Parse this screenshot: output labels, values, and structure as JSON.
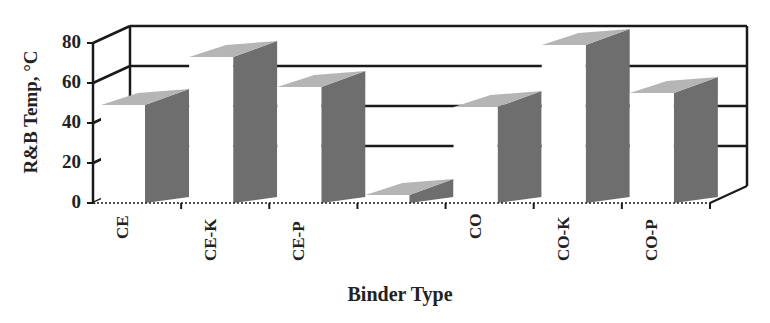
{
  "chart_data": {
    "type": "bar",
    "style": "3d-column",
    "title": "",
    "xlabel": "Binder Type",
    "ylabel": "R&B Temp, °C",
    "categories": [
      "CE",
      "CE-K",
      "CE-P",
      "",
      "CO",
      "CO-K",
      "CO-P"
    ],
    "values": [
      49,
      73,
      58,
      0,
      48,
      79,
      55
    ],
    "yticks": [
      "0",
      "20",
      "40",
      "60",
      "80"
    ],
    "ylim": [
      0,
      80
    ],
    "grid": true,
    "legend": "none",
    "colors": {
      "front": "#ffffff",
      "side": "#6e6e6e",
      "top": "#b5b5b5",
      "axis": "#1a1a1a"
    }
  }
}
